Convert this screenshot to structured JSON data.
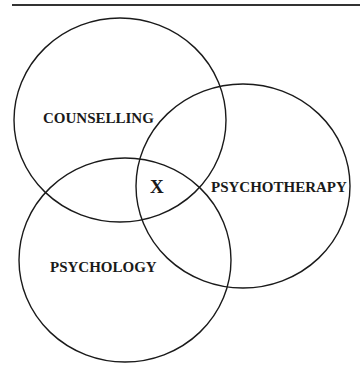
{
  "diagram": {
    "type": "venn",
    "sets": [
      {
        "id": "counselling",
        "label": "COUNSELLING",
        "cx": 120,
        "cy": 120,
        "rx": 106,
        "ry": 102,
        "label_x": 43,
        "label_y": 123
      },
      {
        "id": "psychotherapy",
        "label": "PSYCHOTHERAPY",
        "cx": 243,
        "cy": 186,
        "rx": 107,
        "ry": 102,
        "label_x": 211,
        "label_y": 192
      },
      {
        "id": "psychology",
        "label": "PSYCHOLOGY",
        "cx": 125,
        "cy": 260,
        "rx": 106,
        "ry": 102,
        "label_x": 50,
        "label_y": 272
      }
    ],
    "intersection": {
      "label": "X",
      "x": 150,
      "y": 193
    },
    "stroke_color": "#1a1a1a"
  }
}
